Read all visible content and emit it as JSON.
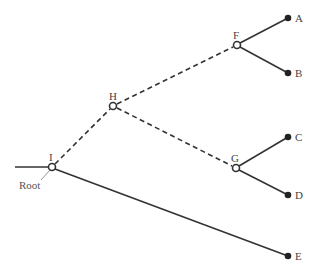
{
  "diagram": {
    "type": "phylogenetic-tree",
    "root_label": "Root",
    "internal_nodes": [
      {
        "id": "I",
        "label": "I",
        "x": 52,
        "y": 167
      },
      {
        "id": "H",
        "label": "H",
        "x": 113,
        "y": 106
      },
      {
        "id": "F",
        "label": "F",
        "x": 237,
        "y": 45
      },
      {
        "id": "G",
        "label": "G",
        "x": 236,
        "y": 168
      }
    ],
    "leaves": [
      {
        "id": "A",
        "label": "A",
        "x": 288,
        "y": 18
      },
      {
        "id": "B",
        "label": "B",
        "x": 288,
        "y": 73
      },
      {
        "id": "C",
        "label": "C",
        "x": 288,
        "y": 137
      },
      {
        "id": "D",
        "label": "D",
        "x": 288,
        "y": 195
      },
      {
        "id": "E",
        "label": "E",
        "x": 288,
        "y": 256
      }
    ],
    "edges": [
      {
        "from": "root",
        "to": "I",
        "style": "solid"
      },
      {
        "from": "I",
        "to": "H",
        "style": "dashed"
      },
      {
        "from": "H",
        "to": "F",
        "style": "dashed"
      },
      {
        "from": "H",
        "to": "G",
        "style": "dashed"
      },
      {
        "from": "F",
        "to": "A",
        "style": "solid"
      },
      {
        "from": "F",
        "to": "B",
        "style": "solid"
      },
      {
        "from": "G",
        "to": "C",
        "style": "solid"
      },
      {
        "from": "G",
        "to": "D",
        "style": "solid"
      },
      {
        "from": "I",
        "to": "E",
        "style": "solid"
      }
    ]
  }
}
